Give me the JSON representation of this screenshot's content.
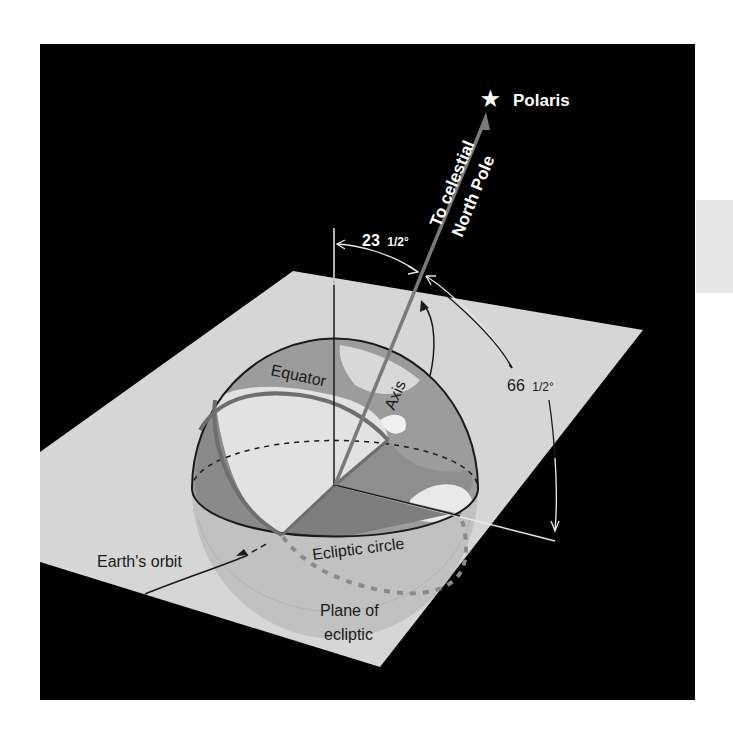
{
  "figure": {
    "type": "diagram",
    "colors": {
      "background": "#000000",
      "plane": "#d6d6d6",
      "sphere_lower": "#bdbdbd",
      "hemisphere_land": "#9a9a9a",
      "hemisphere_light": "#e0e0e0",
      "axis": "#7a7a7a",
      "equator": "#6e6e6e",
      "side_tab": "#e6e6e6"
    }
  },
  "labels": {
    "star": "Polaris",
    "axis_direction_line1": "To celestial",
    "axis_direction_line2": "North Pole",
    "angle_tilt": "23",
    "angle_tilt_fraction": "1/2°",
    "angle_complement": "66",
    "angle_complement_fraction": "1/2°",
    "equator": "Equator",
    "axis": "Axis",
    "earths_orbit": "Earth's orbit",
    "ecliptic_circle": "Ecliptic circle",
    "plane_line1": "Plane of",
    "plane_line2": "ecliptic"
  },
  "icons": {
    "star": "★"
  }
}
